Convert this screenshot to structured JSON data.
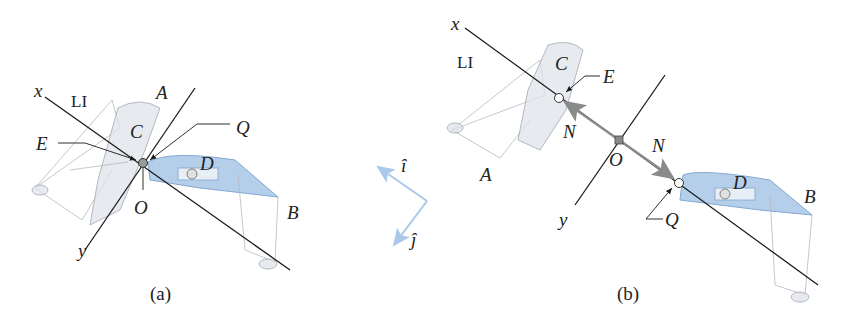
{
  "figure": {
    "panel_a": {
      "caption": "(a)",
      "labels": {
        "x": "x",
        "y": "y",
        "li": "LI",
        "A": "A",
        "B": "B",
        "C": "C",
        "D": "D",
        "E": "E",
        "O": "O",
        "Q": "Q"
      }
    },
    "panel_b": {
      "caption": "(b)",
      "labels": {
        "x": "x",
        "y": "y",
        "li": "LI",
        "A": "A",
        "B": "B",
        "C": "C",
        "D": "D",
        "E": "E",
        "O": "O",
        "Q": "Q",
        "N_left": "N",
        "N_right": "N"
      }
    },
    "unit_vectors": {
      "i": "î",
      "j": "ĵ"
    },
    "colors": {
      "axis": "#1a1a1a",
      "boat_gray": "#dfe3ea",
      "boat_blue": "#a9c7e8",
      "unit_vector": "#a9c8ea",
      "force_arrow": "#8a8a8a"
    }
  }
}
